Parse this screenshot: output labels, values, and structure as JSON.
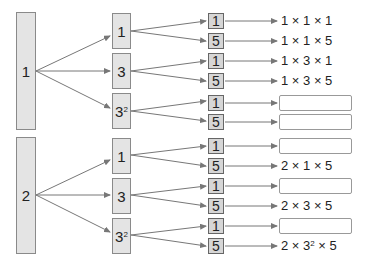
{
  "trees": [
    {
      "root": "1",
      "branches": [
        {
          "label": "1",
          "exp": "",
          "leaves": [
            {
              "label": "1",
              "result": "1 × 1 × 1"
            },
            {
              "label": "5",
              "result": "1 × 1 × 5"
            }
          ]
        },
        {
          "label": "3",
          "exp": "",
          "leaves": [
            {
              "label": "1",
              "result": "1 × 3 × 1"
            },
            {
              "label": "5",
              "result": "1 × 3 × 5"
            }
          ]
        },
        {
          "label": "3",
          "exp": "2",
          "leaves": [
            {
              "label": "1",
              "result": null
            },
            {
              "label": "5",
              "result": null
            }
          ]
        }
      ]
    },
    {
      "root": "2",
      "branches": [
        {
          "label": "1",
          "exp": "",
          "leaves": [
            {
              "label": "1",
              "result": null
            },
            {
              "label": "5",
              "result": "2 × 1 × 5"
            }
          ]
        },
        {
          "label": "3",
          "exp": "",
          "leaves": [
            {
              "label": "1",
              "result": null
            },
            {
              "label": "5",
              "result": "2 × 3 × 5"
            }
          ]
        },
        {
          "label": "3",
          "exp": "2",
          "leaves": [
            {
              "label": "1",
              "result": null
            },
            {
              "label": "5",
              "result_parts": [
                "2 × 3",
                "2",
                " × 5"
              ]
            }
          ]
        }
      ]
    }
  ]
}
